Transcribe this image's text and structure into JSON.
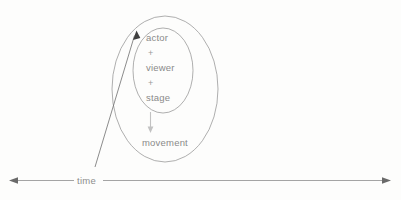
{
  "figure": {
    "background_color": "#fdfdfc",
    "stroke_color": "#8d8d8d",
    "text_color": "#8a8a8a",
    "arrow_dark_color": "#4a4a4a",
    "arrow_light_color": "#c2c2c2"
  },
  "inner_group": {
    "line1": "actor",
    "op1": "+",
    "line2": "viewer",
    "op2": "+",
    "line3": "stage"
  },
  "outcome": {
    "label": "movement"
  },
  "axis": {
    "label": "time"
  },
  "icons": {
    "down_arrow": "downward-arrow",
    "diagonal_arrow": "diagonal-arrow",
    "axis_arrow_left": "left-arrowhead",
    "axis_arrow_right": "right-arrowhead"
  }
}
